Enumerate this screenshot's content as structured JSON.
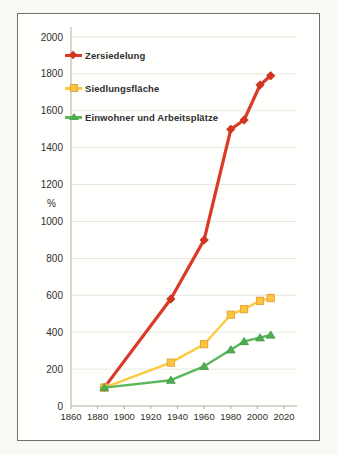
{
  "palette": {
    "page_background": "#FAFAF4",
    "frame_background": "#FFFFFD",
    "frame_border": "#707070",
    "grid_color": "#E6E6E2",
    "axis_color": "#ADADA9",
    "text_color": "#2E2E2E"
  },
  "chart_data": {
    "type": "line",
    "title": "",
    "xlabel": "",
    "ylabel": "%",
    "xlim": [
      1860,
      2020
    ],
    "ylim": [
      0,
      2000
    ],
    "xticks": [
      1860,
      1880,
      1900,
      1920,
      1940,
      1960,
      1980,
      2000,
      2020
    ],
    "yticks": [
      0,
      200,
      400,
      600,
      800,
      1000,
      1200,
      1400,
      1600,
      1800,
      2000
    ],
    "ytick_unit_label": "%",
    "grid": "horizontal",
    "legend_position": "top-left",
    "x": [
      1885,
      1935,
      1960,
      1980,
      1990,
      2002,
      2010
    ],
    "series": [
      {
        "name": "Zersiedelung",
        "color": "#DA3A27",
        "marker": "diamond",
        "marker_fill": "#D23420",
        "marker_stroke": "#C52E1C",
        "values": [
          100,
          580,
          900,
          1500,
          1550,
          1740,
          1790
        ]
      },
      {
        "name": "Siedlungsfläche",
        "color": "#FCCA3E",
        "marker": "square",
        "marker_fill": "#FBC53C",
        "marker_stroke": "#E9A23B",
        "values": [
          100,
          235,
          335,
          495,
          525,
          570,
          585
        ]
      },
      {
        "name": "Einwohner und Arbeitsplätze",
        "color": "#5BB75B",
        "marker": "triangle",
        "marker_fill": "#4FAD51",
        "marker_stroke": "#3F9A44",
        "values": [
          100,
          140,
          215,
          305,
          350,
          370,
          385
        ]
      }
    ]
  }
}
